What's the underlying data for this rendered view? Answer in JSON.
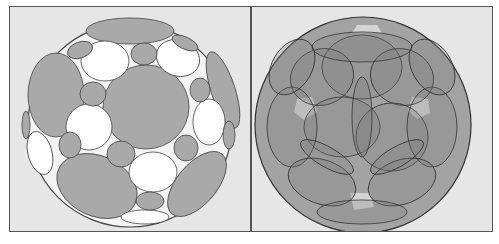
{
  "figure": {
    "panels": [
      {
        "name": "circle-packing-sphere",
        "fill_gray": "#a9a9a9",
        "fill_white": "#ffffff"
      },
      {
        "name": "overlapping-circles-sphere",
        "fill_base": "#a3a3a3",
        "fill_light": "#d8d8d8"
      }
    ],
    "colors": {
      "background": "#e6e6e6",
      "stroke": "#333333"
    }
  }
}
